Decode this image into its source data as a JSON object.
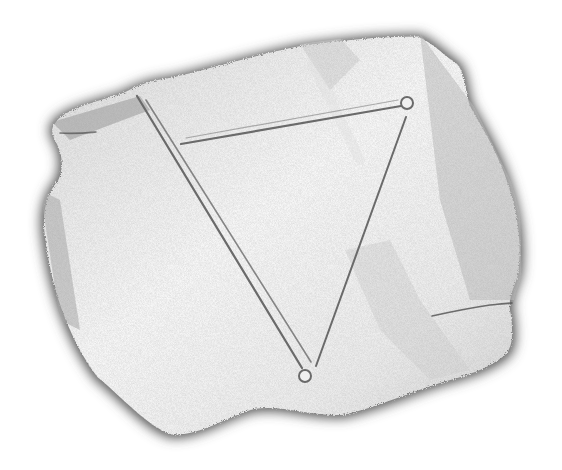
{
  "image": {
    "description": "Grayscale sketch of a torn piece of paper with a hand-drawn inverted triangle",
    "background": "#ffffff",
    "paper": {
      "fill": "#f1f1f1",
      "shadow": "#5a5a5a",
      "shade_dark": "#c8c8c8"
    },
    "drawing": {
      "shape": "inverted triangle",
      "stroke": "#6a6a6a",
      "vertices": [
        [
          140,
          98
        ],
        [
          407,
          103
        ],
        [
          305,
          375
        ]
      ]
    }
  }
}
